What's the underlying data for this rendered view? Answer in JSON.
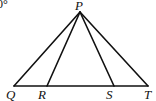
{
  "diagram": {
    "corner_text": "0°",
    "stroke_color": "#111111",
    "background": "#ffffff",
    "points": {
      "P": {
        "label": "P",
        "x": 80,
        "y": 12
      },
      "Q": {
        "label": "Q",
        "x": 14,
        "y": 86
      },
      "R": {
        "label": "R",
        "x": 47,
        "y": 86
      },
      "S": {
        "label": "S",
        "x": 114,
        "y": 86
      },
      "T": {
        "label": "T",
        "x": 148,
        "y": 86
      }
    },
    "segments": [
      "PQ",
      "PR",
      "PS",
      "PT",
      "QT"
    ]
  }
}
